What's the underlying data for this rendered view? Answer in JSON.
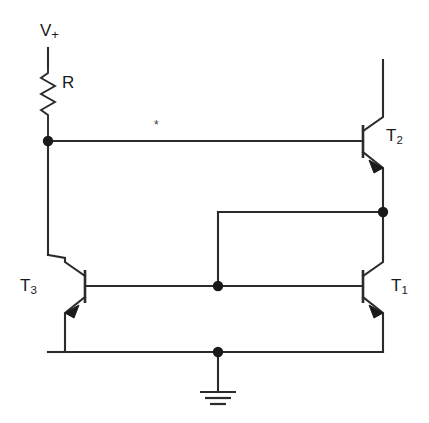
{
  "diagram": {
    "type": "circuit-schematic",
    "background_color": "#ffffff",
    "line_color": "#2b2b2b",
    "node_color": "#1a1a1a"
  },
  "labels": {
    "supply": {
      "text": "V",
      "subscript": "+",
      "full": "V+"
    },
    "resistor": {
      "text": "R"
    },
    "transistor_2": {
      "text": "T",
      "subscript": "2",
      "full": "T2"
    },
    "transistor_1": {
      "text": "T",
      "subscript": "1",
      "full": "T1"
    },
    "transistor_3": {
      "text": "T",
      "subscript": "3",
      "full": "T3"
    },
    "star_marker": {
      "text": "*"
    }
  },
  "components": [
    {
      "id": "R",
      "kind": "resistor",
      "label": "R",
      "orientation": "vertical"
    },
    {
      "id": "T1",
      "kind": "transistor-npn",
      "label": "T1",
      "orientation": "base-left"
    },
    {
      "id": "T2",
      "kind": "transistor-npn",
      "label": "T2",
      "orientation": "base-left"
    },
    {
      "id": "T3",
      "kind": "transistor-npn",
      "label": "T3",
      "orientation": "base-right-mirrored"
    },
    {
      "id": "GND",
      "kind": "ground",
      "label": ""
    },
    {
      "id": "VPLUS",
      "kind": "supply-terminal",
      "label": "V+"
    }
  ],
  "nodes": [
    {
      "id": "n-collector-t3",
      "x": 48,
      "y": 141,
      "junction": true
    },
    {
      "id": "n-emitter-t2",
      "x": 383,
      "y": 212,
      "junction": true
    },
    {
      "id": "n-base-rail",
      "x": 218,
      "y": 286,
      "junction": true
    },
    {
      "id": "n-ground",
      "x": 218,
      "y": 352,
      "junction": true
    }
  ],
  "star_note": "*"
}
